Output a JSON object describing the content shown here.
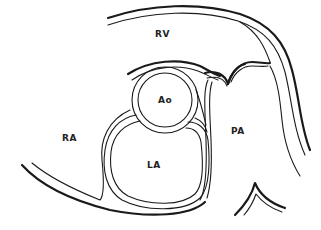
{
  "diagram": {
    "type": "cardiac cross-section (parasternal short axis)",
    "labels": {
      "rv": "RV",
      "ao": "Ao",
      "ra": "RA",
      "la": "LA",
      "pa": "PA"
    },
    "colors": {
      "line": "#1a1a1a",
      "background": "#ffffff",
      "text": "#222222"
    }
  }
}
